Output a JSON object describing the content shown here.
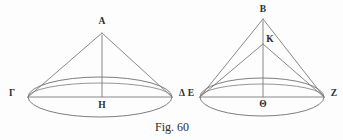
{
  "figure": {
    "caption": "Fig. 60",
    "caption_position": {
      "x": 172,
      "y": 127
    },
    "background_color": "#fdfdfd",
    "line_color": "#7a7a7a",
    "label_color": "#2e2e2e",
    "type": "geometric-diagram"
  },
  "cones": [
    {
      "id": "left-cone",
      "name": "cone-A",
      "apex": {
        "label": "A",
        "x": 102,
        "y": 33,
        "label_x": 102,
        "label_y": 22
      },
      "center": {
        "label": "H",
        "x": 102,
        "y": 97,
        "label_x": 102,
        "label_y": 105
      },
      "left_base": {
        "label": "Γ",
        "x": 28,
        "y": 97,
        "label_x": 10,
        "label_y": 95
      },
      "right_base": {
        "label": "Δ",
        "x": 172,
        "y": 97,
        "label_x": 183,
        "label_y": 95
      },
      "base_ellipse": {
        "cx": 100,
        "cy": 97,
        "rx": 72,
        "ry": 20
      },
      "front_arc_rx": 72,
      "front_arc_ry": 14
    },
    {
      "id": "right-cone",
      "name": "cone-B",
      "apex": {
        "label": "B",
        "x": 263,
        "y": 19,
        "label_x": 263,
        "label_y": 10
      },
      "inner_point": {
        "label": "K",
        "x": 263,
        "y": 44,
        "label_x": 269,
        "label_y": 42
      },
      "center": {
        "label": "Θ",
        "x": 263,
        "y": 97,
        "label_x": 263,
        "label_y": 104
      },
      "left_base": {
        "label": "E",
        "x": 200,
        "y": 97,
        "label_x": 190,
        "label_y": 95
      },
      "right_base": {
        "label": "Z",
        "x": 323,
        "y": 97,
        "label_x": 333,
        "label_y": 95
      },
      "base_ellipse": {
        "cx": 262,
        "cy": 97,
        "rx": 62,
        "ry": 19
      },
      "front_arc_rx": 62,
      "front_arc_ry": 13
    }
  ],
  "labels": {
    "A": "A",
    "Gamma": "Γ",
    "Delta": "Δ",
    "H": "H",
    "B": "B",
    "K": "K",
    "E": "E",
    "Theta": "Θ",
    "Z": "Z"
  }
}
